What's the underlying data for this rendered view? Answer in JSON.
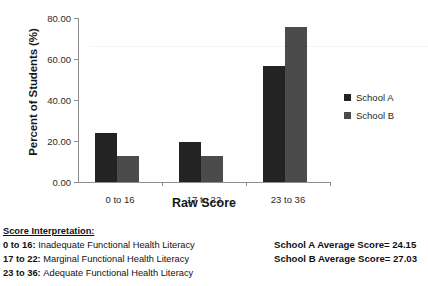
{
  "chart_data": {
    "type": "bar",
    "title": "",
    "xlabel": "Raw Score",
    "ylabel": "Percent of Students (%)",
    "categories": [
      "0 to 16",
      "17 to 22",
      "23 to 36"
    ],
    "ylim": [
      0,
      80
    ],
    "yticks": [
      "0.00",
      "20.00",
      "40.00",
      "60.00",
      "80.00"
    ],
    "ytick_values": [
      0,
      20,
      40,
      60,
      80
    ],
    "grid": false,
    "legend_position": "right",
    "series": [
      {
        "name": "School A",
        "color": "#232323",
        "values": [
          23.9,
          19.5,
          56.6
        ]
      },
      {
        "name": "School B",
        "color": "#4b4b4b",
        "values": [
          12.7,
          12.7,
          75.6
        ]
      }
    ]
  },
  "footnotes": {
    "interpretation_title": "Score Interpretation:",
    "interpretation_rows": [
      {
        "range": "0 to 16:",
        "desc": "Inadequate Functional Health Literacy"
      },
      {
        "range": "17 to 22:",
        "desc": "Marginal Functional Health Literacy"
      },
      {
        "range": "23 to 36:",
        "desc": "Adequate Functional Health Literacy"
      }
    ],
    "average_rows": [
      "School A Average Score= 24.15",
      "School B Average Score= 27.03"
    ]
  }
}
